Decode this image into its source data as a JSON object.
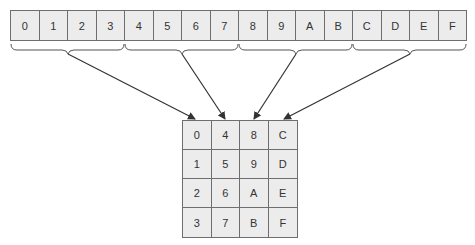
{
  "diagram": {
    "type": "memory-layout-to-matrix",
    "linear_strip": {
      "cells": [
        "0",
        "1",
        "2",
        "3",
        "4",
        "5",
        "6",
        "7",
        "8",
        "9",
        "A",
        "B",
        "C",
        "D",
        "E",
        "F"
      ]
    },
    "groups": [
      {
        "label": "group-0",
        "cells": [
          "0",
          "1",
          "2",
          "3"
        ],
        "target_column": 0
      },
      {
        "label": "group-1",
        "cells": [
          "4",
          "5",
          "6",
          "7"
        ],
        "target_column": 1
      },
      {
        "label": "group-2",
        "cells": [
          "8",
          "9",
          "A",
          "B"
        ],
        "target_column": 2
      },
      {
        "label": "group-3",
        "cells": [
          "C",
          "D",
          "E",
          "F"
        ],
        "target_column": 3
      }
    ],
    "matrix": {
      "rows": [
        [
          "0",
          "4",
          "8",
          "C"
        ],
        [
          "1",
          "5",
          "9",
          "D"
        ],
        [
          "2",
          "6",
          "A",
          "E"
        ],
        [
          "3",
          "7",
          "B",
          "F"
        ]
      ]
    },
    "colors": {
      "cell_fill": "#ececec",
      "border": "#6e6e6e",
      "arrow": "#333333",
      "text": "#333333"
    }
  }
}
